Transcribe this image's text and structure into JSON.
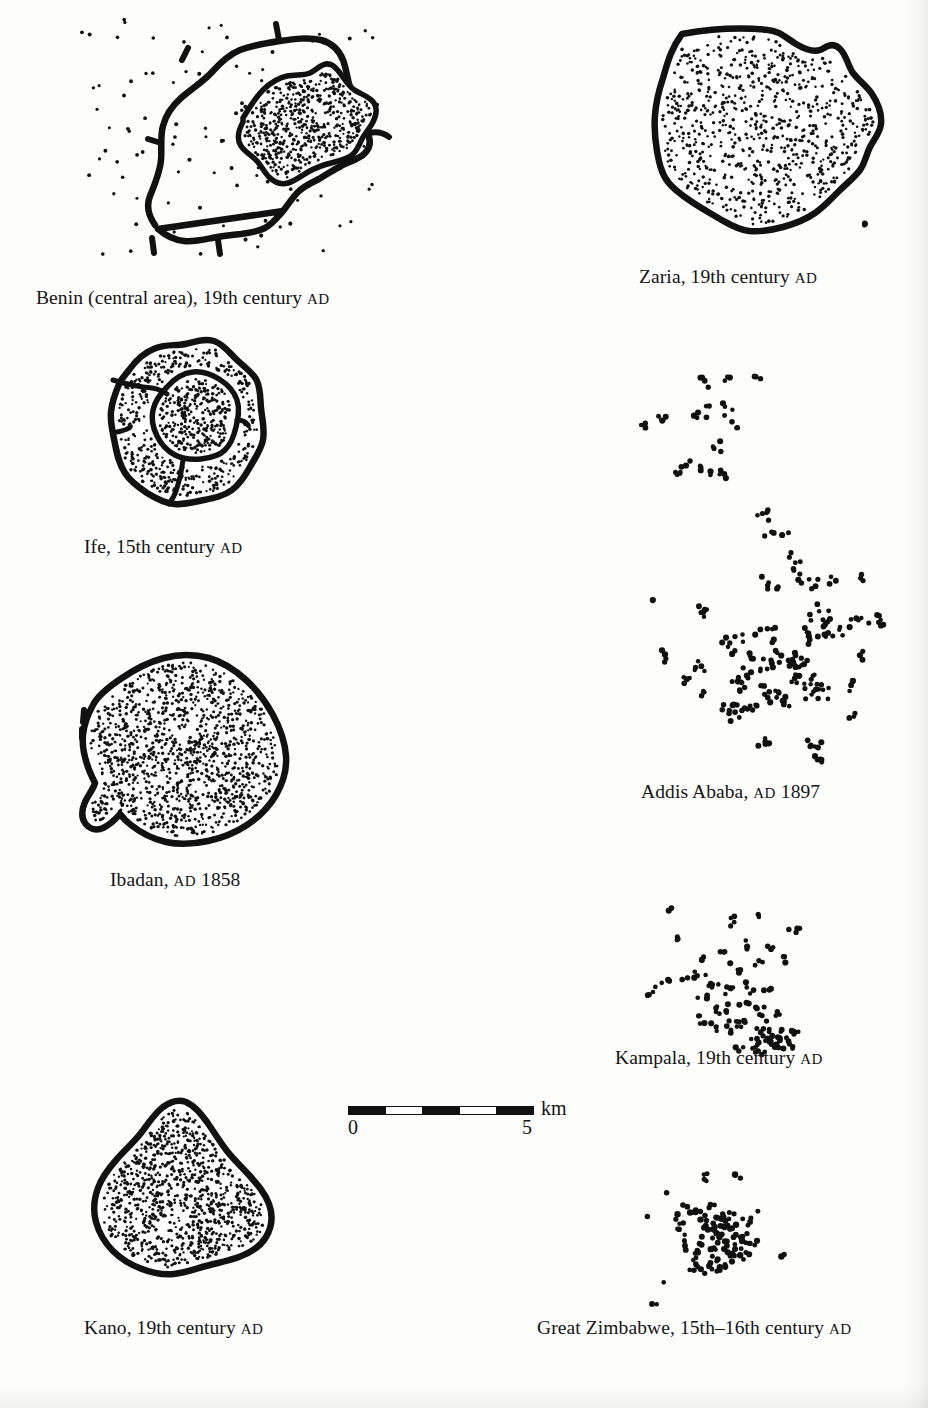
{
  "figure": {
    "kind": "comparative city plans",
    "scalebar": {
      "unit_label": "km",
      "min_label": "0",
      "max_label": "5",
      "segments": [
        "dark",
        "light",
        "dark",
        "light",
        "dark"
      ],
      "length_px": 186
    }
  },
  "panels": [
    {
      "id": "benin",
      "name": "Benin",
      "caption_main": "Benin (central area), 19th century ",
      "caption_smallcaps": "AD",
      "style": "outline-sparse-dots-with-dense-core",
      "caption_x": 36,
      "caption_y": 288
    },
    {
      "id": "zaria",
      "name": "Zaria",
      "caption_main": "Zaria, 19th century ",
      "caption_smallcaps": "AD",
      "style": "outline-stippled",
      "caption_x": 639,
      "caption_y": 267
    },
    {
      "id": "ife",
      "name": "Ife",
      "caption_main": "Ife, 15th century ",
      "caption_smallcaps": "AD",
      "style": "outline-stippled-double-ring",
      "caption_x": 84,
      "caption_y": 537
    },
    {
      "id": "addis-ababa",
      "name": "Addis Ababa",
      "caption_main": "Addis Ababa, ",
      "caption_smallcaps": "AD",
      "caption_tail": " 1897",
      "style": "dot-scatter",
      "caption_x": 641,
      "caption_y": 782
    },
    {
      "id": "ibadan",
      "name": "Ibadan",
      "caption_main": "Ibadan, ",
      "caption_smallcaps": "AD",
      "caption_tail": " 1858",
      "style": "outline-stippled",
      "caption_x": 110,
      "caption_y": 870
    },
    {
      "id": "kampala",
      "name": "Kampala",
      "caption_main": "Kampala, 19th century ",
      "caption_smallcaps": "AD",
      "style": "dot-scatter",
      "caption_x": 615,
      "caption_y": 1048
    },
    {
      "id": "kano",
      "name": "Kano",
      "caption_main": "Kano, 19th century ",
      "caption_smallcaps": "AD",
      "style": "outline-stippled",
      "caption_x": 84,
      "caption_y": 1318
    },
    {
      "id": "great-zimbabwe",
      "name": "Great Zimbabwe",
      "caption_main": "Great Zimbabwe, 15th–16th century ",
      "caption_smallcaps": "AD",
      "style": "dot-scatter",
      "caption_x": 537,
      "caption_y": 1318
    }
  ],
  "colors": {
    "ink": "#111111",
    "paper": "#fdfdfc"
  }
}
